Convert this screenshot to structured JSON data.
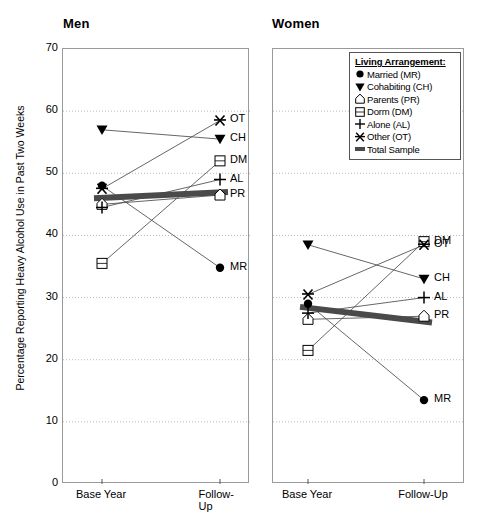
{
  "chart_data": {
    "type": "line",
    "title": "",
    "ylabel": "Percentage Reporting Heavy Alcohol Use in Past Two Weeks",
    "xlabel": "",
    "ylim": [
      0,
      70
    ],
    "yticks": [
      70,
      60,
      50,
      40,
      30,
      20,
      10,
      0
    ],
    "x": [
      "Base Year",
      "Follow-Up"
    ],
    "grid": true,
    "legend_position": "top-right (inside Women panel)",
    "legend_title": "Living Arrangement:",
    "panels": [
      {
        "name": "Men",
        "series": [
          {
            "name": "Married (MR)",
            "code": "MR",
            "marker": "filled-circle",
            "values": [
              48.0,
              34.8
            ]
          },
          {
            "name": "Cohabiting (CH)",
            "code": "CH",
            "marker": "filled-triangle-down",
            "values": [
              57.0,
              55.5
            ]
          },
          {
            "name": "Parents (PR)",
            "code": "PR",
            "marker": "house",
            "values": [
              45.0,
              46.5
            ]
          },
          {
            "name": "Dorm (DM)",
            "code": "DM",
            "marker": "open-square",
            "values": [
              35.5,
              52.0
            ]
          },
          {
            "name": "Alone (AL)",
            "code": "AL",
            "marker": "plus",
            "values": [
              44.5,
              49.0
            ]
          },
          {
            "name": "Other (OT)",
            "code": "OT",
            "marker": "star",
            "values": [
              47.5,
              58.5
            ]
          },
          {
            "name": "Total Sample",
            "code": "TS",
            "marker": "thick-band",
            "values": [
              46.0,
              47.0
            ]
          }
        ]
      },
      {
        "name": "Women",
        "series": [
          {
            "name": "Married (MR)",
            "code": "MR",
            "marker": "filled-circle",
            "values": [
              29.0,
              13.5
            ]
          },
          {
            "name": "Cohabiting (CH)",
            "code": "CH",
            "marker": "filled-triangle-down",
            "values": [
              38.5,
              33.0
            ]
          },
          {
            "name": "Parents (PR)",
            "code": "PR",
            "marker": "house",
            "values": [
              26.5,
              27.0
            ]
          },
          {
            "name": "Dorm (DM)",
            "code": "DM",
            "marker": "open-square",
            "values": [
              21.5,
              39.0
            ]
          },
          {
            "name": "Alone (AL)",
            "code": "AL",
            "marker": "plus",
            "values": [
              27.5,
              30.0
            ]
          },
          {
            "name": "Other (OT)",
            "code": "OT",
            "marker": "star",
            "values": [
              30.5,
              38.5
            ]
          },
          {
            "name": "Total Sample",
            "code": "TS",
            "marker": "thick-band",
            "values": [
              28.5,
              26.0
            ]
          }
        ]
      }
    ]
  },
  "titles": {
    "men": "Men",
    "women": "Women"
  },
  "axis": {
    "ylabel": "Percentage Reporting Heavy Alcohol Use in Past Two Weeks",
    "yticks": [
      "70",
      "60",
      "50",
      "40",
      "30",
      "20",
      "10",
      "0"
    ],
    "xticks": [
      "Base Year",
      "Follow-Up"
    ]
  },
  "legend": {
    "title": "Living Arrangement:",
    "items": [
      {
        "label": "Married (MR)",
        "icon": "filled-circle-icon"
      },
      {
        "label": "Cohabiting (CH)",
        "icon": "filled-triangle-down-icon"
      },
      {
        "label": "Parents (PR)",
        "icon": "house-icon"
      },
      {
        "label": "Dorm (DM)",
        "icon": "open-square-icon"
      },
      {
        "label": "Alone (AL)",
        "icon": "plus-icon"
      },
      {
        "label": "Other (OT)",
        "icon": "star-icon"
      },
      {
        "label": "Total Sample",
        "icon": "thick-band-icon"
      }
    ]
  },
  "point_labels": {
    "men": [
      "OT",
      "CH",
      "DM",
      "AL",
      "PR",
      "MR"
    ],
    "women": [
      "DM",
      "OT",
      "CH",
      "AL",
      "PR",
      "MR"
    ]
  },
  "colors": {
    "ink": "#000000",
    "axis": "#9a9a9a",
    "grid": "#bbbbbb",
    "band": "#4a4a4a"
  }
}
